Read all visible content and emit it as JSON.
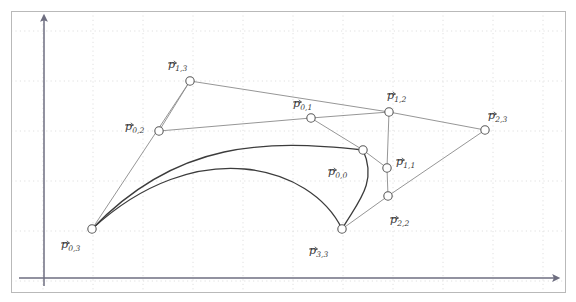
{
  "figure": {
    "background_color": "#ffffff",
    "border_color": "#b9b9b9",
    "grid_color": "#d8d8d8",
    "axis_color": "#6e6e80",
    "net_color": "#8a8a8a",
    "curve_color": "#3c3c3c",
    "point_fill": "#ffffff",
    "point_stroke": "#5a5a5a",
    "frame": {
      "x": 11,
      "y": 11,
      "width": 554,
      "height": 281
    },
    "grid": {
      "spacing": 50,
      "x_lines": [
        43,
        93,
        143,
        193,
        243,
        293,
        343,
        393,
        443,
        493,
        543
      ],
      "y_lines": [
        31,
        81,
        131,
        181,
        231,
        281
      ]
    },
    "axes": {
      "x_axis": {
        "label": "",
        "y": 278,
        "x_start": 19,
        "x_end": 557
      },
      "y_axis": {
        "label": "",
        "x": 44,
        "y_start": 286,
        "y_end": 17
      }
    }
  },
  "chart_data": {
    "type": "scatter",
    "title": "",
    "xlabel": "",
    "ylabel": "",
    "grid": true,
    "legend": null,
    "points": [
      {
        "id": "p03",
        "label": "p",
        "subscript": "0,3",
        "x": 92,
        "y": 229,
        "label_dx": -31,
        "label_dy": 10
      },
      {
        "id": "p02",
        "label": "p",
        "subscript": "0,2",
        "x": 159,
        "y": 131,
        "label_dx": -34,
        "label_dy": -10
      },
      {
        "id": "p13",
        "label": "p",
        "subscript": "1,3",
        "x": 190,
        "y": 81,
        "label_dx": -22,
        "label_dy": -22
      },
      {
        "id": "p01",
        "label": "p",
        "subscript": "0,1",
        "x": 311,
        "y": 118,
        "label_dx": -18,
        "label_dy": -20
      },
      {
        "id": "p12",
        "label": "p",
        "subscript": "1,2",
        "x": 389,
        "y": 112,
        "label_dx": -2,
        "label_dy": -22
      },
      {
        "id": "p23",
        "label": "p",
        "subscript": "2,3",
        "x": 485,
        "y": 130,
        "label_dx": 3,
        "label_dy": -20
      },
      {
        "id": "p00",
        "label": "p",
        "subscript": "0,0",
        "x": 363,
        "y": 150,
        "label_dx": -35,
        "label_dy": 16
      },
      {
        "id": "p11",
        "label": "p",
        "subscript": "1,1",
        "x": 387,
        "y": 168,
        "label_dx": 9,
        "label_dy": -12
      },
      {
        "id": "p22",
        "label": "p",
        "subscript": "2,2",
        "x": 388,
        "y": 196,
        "label_dx": 2,
        "label_dy": 18
      },
      {
        "id": "p33",
        "label": "p",
        "subscript": "3,3",
        "x": 342,
        "y": 229,
        "label_dx": -33,
        "label_dy": 16
      }
    ],
    "net_edges": [
      [
        "p03",
        "p13"
      ],
      [
        "p13",
        "p12"
      ],
      [
        "p02",
        "p01"
      ],
      [
        "p01",
        "p12"
      ],
      [
        "p12",
        "p23"
      ],
      [
        "p23",
        "p22"
      ],
      [
        "p02",
        "p13"
      ],
      [
        "p01",
        "p00"
      ],
      [
        "p12",
        "p11"
      ],
      [
        "p11",
        "p22"
      ],
      [
        "p22",
        "p33"
      ],
      [
        "p00",
        "p11"
      ]
    ],
    "curves": [
      {
        "id": "curve-top",
        "from": "p03",
        "to": "p00",
        "control1": [
          178,
          139
        ],
        "control2": [
          268,
          140
        ]
      },
      {
        "id": "curve-bottom",
        "from": "p00",
        "to": "p33",
        "control1": [
          378,
          183
        ],
        "control2": [
          357,
          203
        ]
      },
      {
        "id": "curve-left",
        "from": "p03",
        "to": "p33",
        "control1": [
          196,
          133
        ],
        "control2": [
          311,
          165
        ]
      }
    ]
  }
}
